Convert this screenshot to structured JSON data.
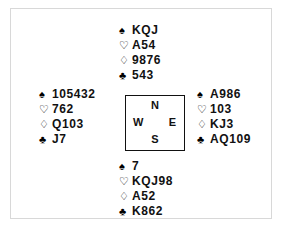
{
  "diagram": {
    "suit_symbols": {
      "spade": "♠",
      "heart": "♡",
      "diamond": "♢",
      "club": "♣"
    },
    "colors": {
      "ink": "#111111",
      "frame": "#d8d8d8",
      "box_border": "#111111",
      "background": "#ffffff"
    },
    "compass": {
      "north": "N",
      "south": "S",
      "west": "W",
      "east": "E"
    },
    "hands": {
      "north": {
        "position": "North",
        "spades": "KQJ",
        "hearts": "A54",
        "diamonds": "9876",
        "clubs": "543"
      },
      "west": {
        "position": "West",
        "spades": "105432",
        "hearts": "762",
        "diamonds": "Q103",
        "clubs": "J7"
      },
      "east": {
        "position": "East",
        "spades": "A986",
        "hearts": "103",
        "diamonds": "KJ3",
        "clubs": "AQ109"
      },
      "south": {
        "position": "South",
        "spades": "7",
        "hearts": "KQJ98",
        "diamonds": "A52",
        "clubs": "K862"
      }
    }
  }
}
